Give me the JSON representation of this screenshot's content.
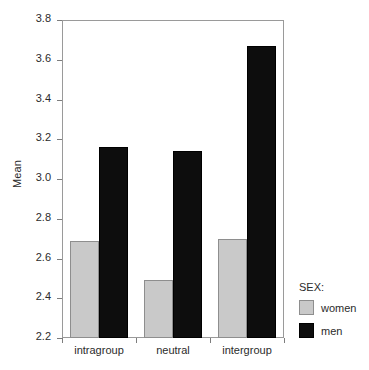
{
  "chart_data": {
    "type": "bar",
    "title": "",
    "subtitle": "",
    "xlabel": "",
    "ylabel": "Mean",
    "categories": [
      "intragroup",
      "neutral",
      "intergroup"
    ],
    "series": [
      {
        "name": "women",
        "color": "#c9c9c9",
        "values": [
          2.69,
          2.49,
          2.7
        ]
      },
      {
        "name": "men",
        "color": "#0d0d0d",
        "values": [
          3.16,
          3.14,
          3.67
        ]
      }
    ],
    "ylim": [
      2.2,
      3.8
    ],
    "ytick_values": [
      2.2,
      2.4,
      2.6,
      2.8,
      3.0,
      3.2,
      3.4,
      3.6,
      3.8
    ],
    "ytick_labels": [
      "2.2",
      "2.4",
      "2.6",
      "2.8",
      "3.0",
      "3.2",
      "3.4",
      "3.6",
      "3.8"
    ],
    "grid": false,
    "legend_position": "right-bottom",
    "legend_title": "SEX:",
    "legend_entries": [
      "women",
      "men"
    ],
    "annotations": []
  }
}
